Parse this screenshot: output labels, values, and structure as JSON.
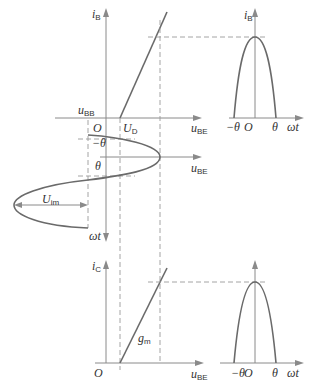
{
  "diagram": {
    "title": "",
    "top_left": {
      "y_axis": {
        "main": "i",
        "sub": "B"
      },
      "x_axis": {
        "main": "u",
        "sub": "BE"
      },
      "bias_label": {
        "main": "u",
        "sub": "BB"
      },
      "origin": "O",
      "threshold": {
        "main": "U",
        "sub": "D"
      }
    },
    "top_right": {
      "y_axis": {
        "main": "i",
        "sub": "B"
      },
      "x_axis": "ωt",
      "neg_theta": "−θ",
      "origin": "O",
      "pos_theta": "θ"
    },
    "middle": {
      "neg_theta": "−θ",
      "pos_theta": "θ",
      "x_axis": {
        "main": "u",
        "sub": "BE"
      },
      "amplitude": {
        "main": "U",
        "sub": "im"
      },
      "time_axis": "ωt"
    },
    "bottom_left": {
      "y_axis": {
        "main": "i",
        "sub": "C"
      },
      "x_axis": {
        "main": "u",
        "sub": "BE"
      },
      "origin": "O",
      "slope": {
        "main": "g",
        "sub": "m"
      }
    },
    "bottom_right": {
      "x_axis": "ωt",
      "neg_theta": "−θ",
      "origin": "O",
      "pos_theta": "θ"
    }
  }
}
